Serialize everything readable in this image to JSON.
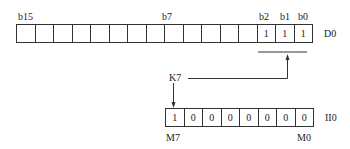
{
  "top_register": {
    "name": "D0",
    "bit_labels": {
      "b15": "b15",
      "b7": "b7",
      "b2": "b2",
      "b1": "b1",
      "b0": "b0"
    },
    "cells": [
      "",
      "",
      "",
      "",
      "",
      "",
      "",
      "",
      "",
      "",
      "",
      "",
      "",
      "1",
      "1",
      "1"
    ]
  },
  "source_label": "K7",
  "bottom_register": {
    "name": "II0",
    "cells": [
      "1",
      "0",
      "0",
      "0",
      "0",
      "0",
      "0",
      "0"
    ],
    "left_label": "M7",
    "right_label": "M0"
  }
}
